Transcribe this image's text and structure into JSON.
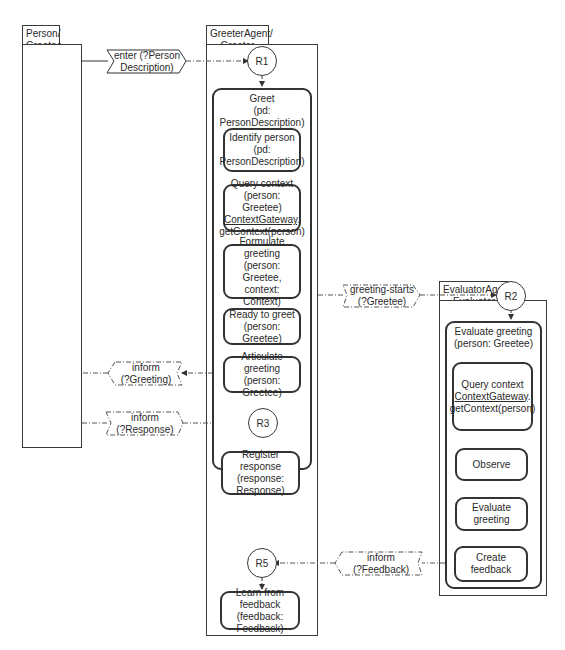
{
  "lanes": {
    "person": {
      "title_line1": "Person/",
      "title_line2": "Greetee"
    },
    "greeter": {
      "title_line1": "GreeterAgent/",
      "title_line2": "Greeter"
    },
    "evaluator": {
      "title_line1": "EvaluatorAgent/",
      "title_line2": "Evaluator"
    }
  },
  "greeter": {
    "r1": "R1",
    "r3": "R3",
    "r5": "R5",
    "goal": {
      "line1": "Greet",
      "line2": "(pd: PersonDescription)"
    },
    "activities": {
      "identify": {
        "line1": "Identify person",
        "line2": "(pd:",
        "line3": "PersonDescription)"
      },
      "query": {
        "line1": "Query context",
        "line2": "(person: Greetee)",
        "line3": "ContextGateway",
        "line3b": ".",
        "line4": "getContext(person)"
      },
      "formulate": {
        "line1": "Formulate",
        "line2": "greeting",
        "line3": "(person: Greetee,",
        "line4": "context: Context)"
      },
      "ready": {
        "line1": "Ready to greet",
        "line2": "(person: Greetee)"
      },
      "articulate": {
        "line1": "Articulate",
        "line2": "greeting",
        "line3": "(person: Greetee)"
      },
      "register": {
        "line1": "Register response",
        "line2": "(response:",
        "line3": "Response)"
      },
      "learn": {
        "line1": "Learn from",
        "line2": "feedback",
        "line3": "(feedback: Feedback)"
      }
    }
  },
  "evaluator": {
    "r2": "R2",
    "goal": {
      "line1": "Evaluate greeting",
      "line2": "(person: Greetee)"
    },
    "activities": {
      "query": {
        "line1": "Query context",
        "line2": "ContextGateway",
        "line2b": ".",
        "line3": "getContext(person)"
      },
      "observe": {
        "line1": "Observe"
      },
      "evaluate": {
        "line1": "Evaluate",
        "line2": "greeting"
      },
      "create": {
        "line1": "Create",
        "line2": "feedback"
      }
    }
  },
  "messages": {
    "enter": {
      "line1": "enter (?Person",
      "line2": "Description)"
    },
    "greeting_starts": {
      "line1": "greeting-starts",
      "line2": "(?Greetee)"
    },
    "inform_greeting": {
      "line1": "inform",
      "line2": "(?Greeting)"
    },
    "inform_response": {
      "line1": "inform",
      "line2": "(?Response)"
    },
    "inform_feedback": {
      "line1": "inform",
      "line2": "(?Feedback)"
    }
  },
  "colors": {
    "line": "#333333",
    "dashed": "#555555",
    "background": "#ffffff"
  }
}
